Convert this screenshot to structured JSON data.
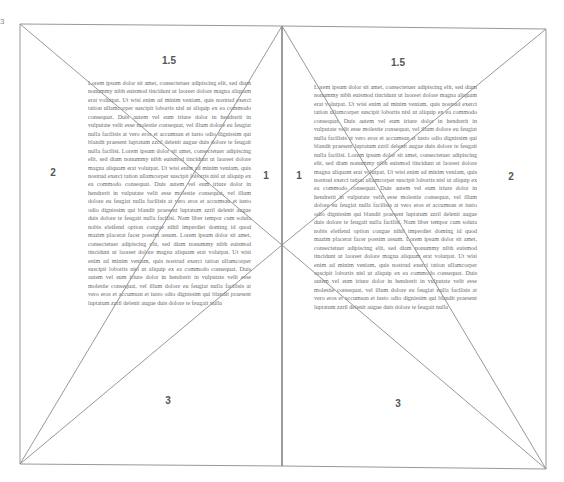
{
  "diagram": {
    "corner_marker": "3",
    "left_page": {
      "labels": {
        "top": "1.5",
        "left": "2",
        "right": "1",
        "bottom": "3"
      },
      "body_text": "Lorem ipsum dolor sit amet, consectetuer adipiscing elit, sed diam nonummy nibh euismod tincidunt ut laoreet dolore magna aliquam erat volutpat. Ut wisi enim ad minim veniam, quis nostrud exerci tation ullamcorper suscipit lobortis nisl ut aliquip ex ea commodo consequat. Duis autem vel eum iriure dolor in hendrerit in vulputate velit esse molestie consequat, vel illum dolore eu feugiat nulla facilisis at vero eros et accumsan et iusto odio dignissim qui blandit praesent luptatum zzril delenit augue duis dolore te feugait nulla facilisi. Lorem ipsum dolor sit amet, consectetuer adipiscing elit, sed diam nonummy nibh euismod tincidunt ut laoreet dolore magna aliquam erat volutpat. Ut wisi enim ad minim veniam, quis nostrud exerci tation ullamcorper suscipit lobortis nisl ut aliquip ex ea commodo consequat. Duis autem vel eum iriure dolor in hendrerit in vulputate velit esse molestie consequat, vel illum dolore eu feugiat nulla facilisis at vero eros et accumsan et iusto odio dignissim qui blandit praesent luptatum zzril delenit augue duis dolore te feugait nulla facilisi. Nam liber tempor cum soluta nobis eleifend option congue nihil imperdiet doming id quod mazim placerat facer possim assum. Lorem ipsum dolor sit amet, consectetuer adipiscing elit, sed diam nonummy nibh euismod tincidunt ut laoreet dolore magna aliquam erat volutpat. Ut wisi enim ad minim veniam, quis nostrud exerci tation ullamcorper suscipit lobortis nisl ut aliquip ex ea commodo consequat. Duis autem vel eum iriure dolor in hendrerit in vulputate velit esse molestie consequat, vel illum dolore eu feugiat nulla facilisis at vero eros et accumsan et iusto odio dignissim qui blandit praesent luptatum zzril delenit augue duis dolore te feugait nulla"
    },
    "right_page": {
      "labels": {
        "top": "1.5",
        "left": "1",
        "right": "2",
        "bottom": "3"
      },
      "body_text": "Lorem ipsum dolor sit amet, consectetuer adipiscing elit, sed diam nonummy nibh euismod tincidunt ut laoreet dolore magna aliquam erat volutpat. Ut wisi enim ad minim veniam, quis nostrud exerci tation ullamcorper suscipit lobortis nisl ut aliquip ex ea commodo consequat. Duis autem vel eum iriure dolor in hendrerit in vulputate velit esse molestie consequat, vel illum dolore eu feugiat nulla facilisis at vero eros et accumsan et iusto odio dignissim qui blandit praesent luptatum zzril delenit augue duis dolore te feugait nulla facilisi. Lorem ipsum dolor sit amet, consectetuer adipiscing elit, sed diam nonummy nibh euismod tincidunt ut laoreet dolore magna aliquam erat volutpat. Ut wisi enim ad minim veniam, quis nostrud exerci tation ullamcorper suscipit lobortis nisl ut aliquip ex ea commodo consequat. Duis autem vel eum iriure dolor in hendrerit in vulputate velit esse molestie consequat, vel illum dolore eu feugiat nulla facilisis at vero eros et accumsan et iusto odio dignissim qui blandit praesent luptatum zzril delenit augue duis dolore te feugait nulla facilisi. Nam liber tempor cum soluta nobis eleifend option congue nihil imperdiet doming id quod mazim placerat facer possim assum. Lorem ipsum dolor sit amet, consectetuer adipiscing elit, sed diam nonummy nibh euismod tincidunt ut laoreet dolore magna aliquam erat volutpat. Ut wisi enim ad minim veniam, quis nostrud exerci tation ullamcorper suscipit lobortis nisl ut aliquip ex ea commodo consequat. Duis autem vel eum iriure dolor in hendrerit in vulputate velit esse molestie consequat, vel illum dolore eu feugiat nulla facilisis at vero eros et accumsan et iusto odio dignissim qui blandit praesent luptatum zzril delenit augue duis dolore te feugait nulla"
    },
    "colors": {
      "line": "#8c8c8c",
      "label": "#555555",
      "text": "#6b6b6b"
    }
  }
}
